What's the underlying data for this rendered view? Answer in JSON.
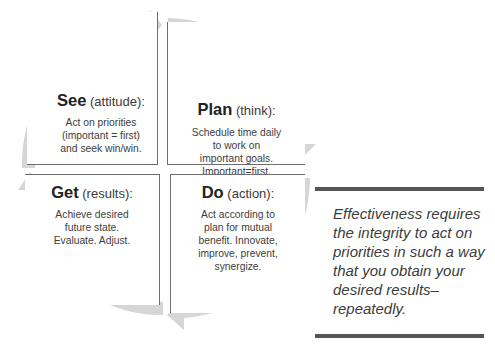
{
  "diagram": {
    "type": "cycle",
    "arrow_color": "#d4d4d4",
    "quadrants": [
      {
        "position": "top-left",
        "title": "See",
        "subtitle": "(attitude):",
        "body": [
          "Act on priorities",
          "(important = first)",
          "and seek win/win."
        ]
      },
      {
        "position": "top-right",
        "title": "Plan",
        "subtitle": "(think):",
        "body": [
          "Schedule time daily",
          "to work on",
          "important goals.",
          "Important=first."
        ]
      },
      {
        "position": "bottom-right",
        "title": "Do",
        "subtitle": "(action):",
        "body": [
          "Act according to",
          "plan for mutual",
          "benefit. Innovate,",
          "improve, prevent,",
          "synergize."
        ]
      },
      {
        "position": "bottom-left",
        "title": "Get",
        "subtitle": "(results):",
        "body": [
          "Achieve desired",
          "future state.",
          "Evaluate. Adjust."
        ]
      }
    ]
  },
  "callout": {
    "text_lines": [
      "Effectiveness requires",
      "the integrity to act on",
      "priorities in such a way",
      "that you obtain your",
      "desired results–",
      "repeatedly."
    ],
    "bar_color": "#555555"
  }
}
